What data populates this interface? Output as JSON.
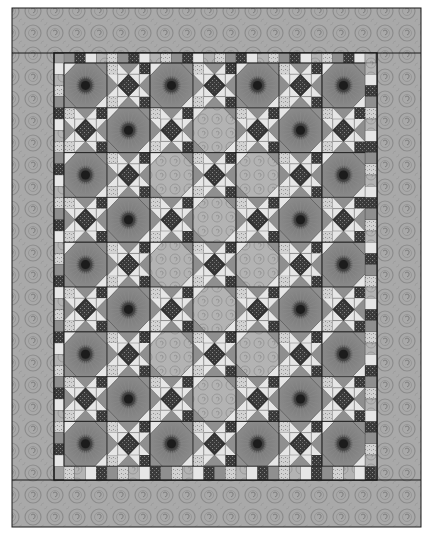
{
  "colors": {
    "background": "#ffffff",
    "border_fabric": "#a9a9a9",
    "border_swirl": "#8c8c8c",
    "seam": "#1a1a1a",
    "eye_ring": "#7a7a7a",
    "eye_ray": "#8e8e8e",
    "eye_center": "#1c1c1c",
    "eye_iris": "#4a4a4a",
    "plain_fabric": "#b3b3b3",
    "star_center": "#333333",
    "star_geese_light": "#e6e6e6",
    "star_geese_mid": "#8f8f8f",
    "star_geese_dark": "#6a6a6a",
    "corner_dark": "#3a3a3a",
    "corner_light": "#cfcfcf",
    "corner_mid": "#a0a0a0"
  },
  "layout": {
    "outer": {
      "x": 12,
      "y": 8,
      "w": 409,
      "h": 519
    },
    "inner": {
      "x": 54,
      "y": 53,
      "w": 323,
      "h": 427
    },
    "grid": {
      "x": 64,
      "y": 63,
      "cols": 7,
      "rows": 9,
      "cell_w": 43,
      "cell_h": 44.8
    }
  },
  "blocks": [
    [
      "E",
      "S",
      "E",
      "S",
      "E",
      "S",
      "E"
    ],
    [
      "S",
      "E",
      "S",
      "P",
      "S",
      "E",
      "S"
    ],
    [
      "E",
      "S",
      "P",
      "S",
      "P",
      "S",
      "E"
    ],
    [
      "S",
      "E",
      "S",
      "P",
      "S",
      "E",
      "S"
    ],
    [
      "E",
      "S",
      "P",
      "S",
      "P",
      "S",
      "E"
    ],
    [
      "S",
      "E",
      "S",
      "P",
      "S",
      "E",
      "S"
    ],
    [
      "E",
      "S",
      "P",
      "S",
      "P",
      "S",
      "E"
    ],
    [
      "S",
      "E",
      "S",
      "P",
      "S",
      "E",
      "S"
    ],
    [
      "E",
      "S",
      "E",
      "S",
      "E",
      "S",
      "E"
    ]
  ],
  "legend": {
    "E": "eye-octagon-block",
    "S": "star-block",
    "P": "plain-octagon-block"
  }
}
